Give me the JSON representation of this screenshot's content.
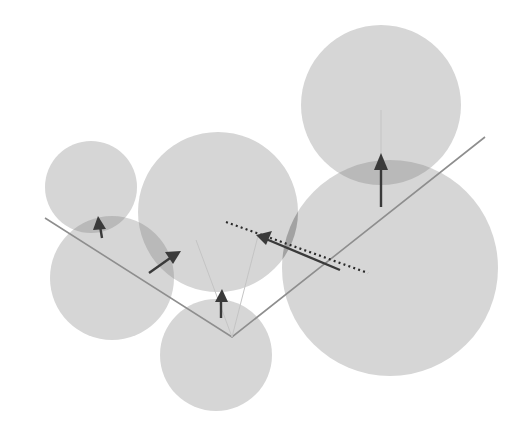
{
  "diagram": {
    "title": "",
    "colors": {
      "background": "#ffffff",
      "circle_light": "#d6d6d6",
      "overlap_mid": "#b9b9b9",
      "overlap_dark": "#a2a2a2",
      "polyline": "#8e8e8e",
      "arrow": "#3a3a3a",
      "dotted_line": "#2a2a2a"
    },
    "polyline": {
      "points": [
        [
          45,
          218
        ],
        [
          232,
          337
        ],
        [
          485,
          137
        ]
      ]
    },
    "circles": [
      {
        "id": "left-small",
        "cx": 91,
        "cy": 187,
        "r": 46
      },
      {
        "id": "lower-left",
        "cx": 112,
        "cy": 278,
        "r": 62
      },
      {
        "id": "center-large",
        "cx": 218,
        "cy": 212,
        "r": 80
      },
      {
        "id": "bottom",
        "cx": 216,
        "cy": 355,
        "r": 56
      },
      {
        "id": "top-right",
        "cx": 381,
        "cy": 105,
        "r": 80
      },
      {
        "id": "lower-right-large",
        "cx": 390,
        "cy": 268,
        "r": 108
      }
    ],
    "arrows": [
      {
        "id": "arrow-left-small",
        "from": [
          102,
          238
        ],
        "to": [
          99,
          218
        ]
      },
      {
        "id": "arrow-mid-left",
        "from": [
          149,
          273
        ],
        "to": [
          181,
          251
        ]
      },
      {
        "id": "arrow-bottom",
        "from": [
          221,
          318
        ],
        "to": [
          222,
          290
        ]
      },
      {
        "id": "arrow-center",
        "from": [
          340,
          270
        ],
        "to": [
          256,
          235
        ]
      },
      {
        "id": "arrow-top-right",
        "from": [
          381,
          207
        ],
        "to": [
          381,
          153
        ]
      }
    ],
    "dotted_line": {
      "from": [
        226,
        222
      ],
      "to": [
        368,
        273
      ]
    },
    "labels": []
  }
}
